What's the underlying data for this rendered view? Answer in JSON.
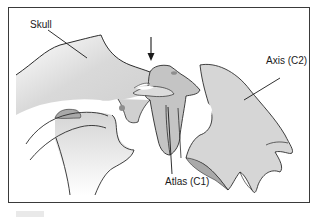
{
  "figure": {
    "labels": {
      "skull": "Skull",
      "atlas": "Atlas (C1)",
      "axis": "Axis (C2)"
    },
    "indicator": "downward-arrow",
    "colors": {
      "bone_fill": "#d6d6d6",
      "bone_dark": "#a9a9a9",
      "joint_dot": "#8e8e8e",
      "outline": "#2b2b2b",
      "frame": "#3a3a3a"
    }
  }
}
